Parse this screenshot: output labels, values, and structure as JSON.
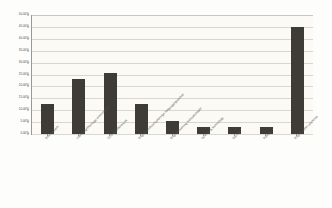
{
  "chart_data": {
    "type": "bar",
    "title": "",
    "xlabel": "",
    "ylabel": "",
    "grid": true,
    "legend": false,
    "ylim": [
      0,
      50
    ],
    "ytick_labels": [
      "50.00%",
      "45.00%",
      "40.00%",
      "35.00%",
      "30.00%",
      "25.00%",
      "20.00%",
      "15.00%",
      "10.00%",
      "5.00%",
      "0.00%"
    ],
    "ytick_values": [
      50,
      45,
      40,
      35,
      30,
      25,
      20,
      15,
      10,
      5,
      0
    ],
    "categories": [
      "Environment",
      "Life/foreign/heritage environment",
      "Cultural differences",
      "English proficiency/foreign language/grammar",
      "English learning motivation/skill",
      "Science & technology",
      "Society",
      "Politics",
      "English/other countries"
    ],
    "values": [
      12.5,
      23.0,
      25.5,
      12.5,
      5.5,
      3.0,
      3.0,
      3.0,
      45.0
    ],
    "value_labels": [
      "12.50%",
      "23.00%",
      "25.50%",
      "12.50%",
      "5.50%",
      "3.00%",
      "3.00%",
      "3.00%",
      "45.00%"
    ],
    "bar_color": "#3f3c38",
    "plot_background": "#fbfaf5",
    "gridline_color": "#d9d8d0",
    "axis_color": "#9a9a93"
  }
}
